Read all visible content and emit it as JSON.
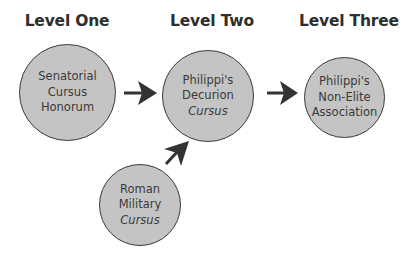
{
  "levels": [
    {
      "title": "Level One"
    },
    {
      "title": "Level Two"
    },
    {
      "title": "Level Three"
    }
  ],
  "nodes": {
    "senatorial": {
      "lines": [
        "Senatorial",
        "Cursus",
        "Honorum"
      ]
    },
    "decurion": {
      "lines": [
        "Philippi's",
        "Decurion",
        "Cursus"
      ],
      "italic_line": 2
    },
    "non_elite": {
      "lines": [
        "Philippi's",
        "Non-Elite",
        "Association"
      ]
    },
    "military": {
      "lines": [
        "Roman",
        "Military",
        "Cursus"
      ],
      "italic_line": 2
    }
  },
  "edges": [
    {
      "from": "Senatorial Cursus Honorum",
      "to": "Philippi's Decurion Cursus"
    },
    {
      "from": "Philippi's Decurion Cursus",
      "to": "Philippi's Non-Elite Association"
    },
    {
      "from": "Roman Military Cursus",
      "to": "Philippi's Decurion Cursus"
    }
  ],
  "colors": {
    "node_fill": "#c4c4c4",
    "node_stroke": "#3a3a3a",
    "arrow": "#333333",
    "title": "#2e2e2e"
  }
}
